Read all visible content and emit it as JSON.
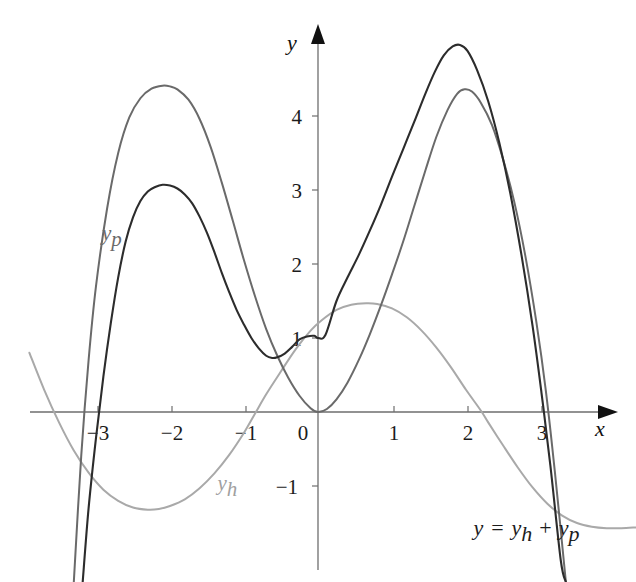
{
  "chart_data": {
    "type": "line",
    "title": "",
    "xlabel": "x",
    "ylabel": "y",
    "xlim": [
      -3.9,
      4.3
    ],
    "ylim": [
      -2.3,
      5.5
    ],
    "grid": false,
    "legend_position": "inline-curve-labels",
    "annotations": [
      {
        "text": "y = y_h + y_p",
        "x": 2.1,
        "y": -1.66
      }
    ],
    "xticks": [
      -3,
      -2,
      -1,
      0,
      1,
      2,
      3
    ],
    "xtick_labels": [
      "−3",
      "−2",
      "−1",
      "0",
      "1",
      "2",
      "3"
    ],
    "yticks": [
      -1,
      1,
      2,
      3,
      4
    ],
    "ytick_labels": [
      "−1",
      "1",
      "2",
      "3",
      "4"
    ],
    "series": [
      {
        "name": "y_p",
        "label": "y",
        "label_sub": "p",
        "color": "#6a6a6a",
        "width": 2.0,
        "label_x": -2.92,
        "label_y": 2.32,
        "description": "particular solution, even-like double-humped curve through the origin, peaks 4.4 near x=-2 and 4.35 near x=1.95",
        "points": [
          [
            -3.3,
            -2.3
          ],
          [
            -3.2,
            -0.6
          ],
          [
            -3.1,
            0.7
          ],
          [
            -3.0,
            1.7
          ],
          [
            -2.85,
            2.75
          ],
          [
            -2.7,
            3.5
          ],
          [
            -2.55,
            3.98
          ],
          [
            -2.4,
            4.24
          ],
          [
            -2.25,
            4.37
          ],
          [
            -2.1,
            4.41
          ],
          [
            -2.0,
            4.4
          ],
          [
            -1.9,
            4.36
          ],
          [
            -1.75,
            4.22
          ],
          [
            -1.6,
            3.96
          ],
          [
            -1.45,
            3.58
          ],
          [
            -1.3,
            3.1
          ],
          [
            -1.15,
            2.58
          ],
          [
            -1.0,
            2.05
          ],
          [
            -0.85,
            1.56
          ],
          [
            -0.7,
            1.12
          ],
          [
            -0.55,
            0.76
          ],
          [
            -0.4,
            0.46
          ],
          [
            -0.25,
            0.22
          ],
          [
            -0.1,
            0.05
          ],
          [
            0.0,
            0.0
          ],
          [
            0.12,
            0.04
          ],
          [
            0.25,
            0.17
          ],
          [
            0.4,
            0.4
          ],
          [
            0.55,
            0.7
          ],
          [
            0.7,
            1.05
          ],
          [
            0.85,
            1.44
          ],
          [
            1.0,
            1.86
          ],
          [
            1.15,
            2.3
          ],
          [
            1.3,
            2.78
          ],
          [
            1.45,
            3.26
          ],
          [
            1.6,
            3.72
          ],
          [
            1.75,
            4.08
          ],
          [
            1.88,
            4.3
          ],
          [
            1.98,
            4.36
          ],
          [
            2.08,
            4.33
          ],
          [
            2.2,
            4.18
          ],
          [
            2.35,
            3.88
          ],
          [
            2.5,
            3.42
          ],
          [
            2.65,
            2.85
          ],
          [
            2.8,
            2.12
          ],
          [
            2.95,
            1.22
          ],
          [
            3.08,
            0.28
          ],
          [
            3.2,
            -0.8
          ],
          [
            3.35,
            -2.3
          ]
        ]
      },
      {
        "name": "y_h",
        "label": "y",
        "label_sub": "h",
        "color": "#a9a9a9",
        "width": 2.0,
        "label_x": -1.36,
        "label_y": -1.05,
        "description": "homogeneous solution, smooth wave: min -1.30 near x=-2.2, rises through zero near x=-0.85, max 1.47 near x=0.73, falls through zero near x=2.25 to about -1.55 at right edge",
        "points": [
          [
            -3.9,
            0.8
          ],
          [
            -3.7,
            0.3
          ],
          [
            -3.5,
            -0.14
          ],
          [
            -3.3,
            -0.52
          ],
          [
            -3.1,
            -0.82
          ],
          [
            -2.9,
            -1.05
          ],
          [
            -2.7,
            -1.2
          ],
          [
            -2.5,
            -1.29
          ],
          [
            -2.3,
            -1.32
          ],
          [
            -2.15,
            -1.31
          ],
          [
            -2.0,
            -1.27
          ],
          [
            -1.8,
            -1.18
          ],
          [
            -1.6,
            -1.03
          ],
          [
            -1.4,
            -0.83
          ],
          [
            -1.2,
            -0.58
          ],
          [
            -1.0,
            -0.28
          ],
          [
            -0.85,
            -0.02
          ],
          [
            -0.7,
            0.24
          ],
          [
            -0.5,
            0.55
          ],
          [
            -0.3,
            0.85
          ],
          [
            -0.1,
            1.1
          ],
          [
            0.05,
            1.24
          ],
          [
            0.25,
            1.38
          ],
          [
            0.45,
            1.45
          ],
          [
            0.65,
            1.47
          ],
          [
            0.8,
            1.46
          ],
          [
            1.0,
            1.4
          ],
          [
            1.2,
            1.28
          ],
          [
            1.4,
            1.1
          ],
          [
            1.6,
            0.87
          ],
          [
            1.8,
            0.6
          ],
          [
            2.0,
            0.3
          ],
          [
            2.2,
            0.02
          ],
          [
            2.3,
            -0.14
          ],
          [
            2.5,
            -0.45
          ],
          [
            2.7,
            -0.75
          ],
          [
            2.9,
            -1.02
          ],
          [
            3.1,
            -1.24
          ],
          [
            3.3,
            -1.4
          ],
          [
            3.5,
            -1.5
          ],
          [
            3.7,
            -1.55
          ],
          [
            3.9,
            -1.57
          ],
          [
            4.1,
            -1.57
          ],
          [
            4.3,
            -1.56
          ]
        ]
      },
      {
        "name": "y",
        "label": "y",
        "label_sub": "",
        "color": "#2c2c2c",
        "width": 2.1,
        "label_x": null,
        "label_y": null,
        "description": "sum y = y_h + y_p, peaks 3.05 near x=-2 and 4.95 near x=1.9, local min 0.73 near x=-0.68, crosses y-axis at 1.0",
        "points": [
          [
            -3.18,
            -2.3
          ],
          [
            -3.1,
            -1.3
          ],
          [
            -3.0,
            -0.35
          ],
          [
            -2.9,
            0.48
          ],
          [
            -2.8,
            1.2
          ],
          [
            -2.7,
            1.82
          ],
          [
            -2.6,
            2.3
          ],
          [
            -2.5,
            2.63
          ],
          [
            -2.4,
            2.85
          ],
          [
            -2.3,
            2.98
          ],
          [
            -2.2,
            3.04
          ],
          [
            -2.1,
            3.07
          ],
          [
            -2.0,
            3.06
          ],
          [
            -1.9,
            3.02
          ],
          [
            -1.8,
            2.94
          ],
          [
            -1.7,
            2.82
          ],
          [
            -1.6,
            2.64
          ],
          [
            -1.5,
            2.42
          ],
          [
            -1.4,
            2.16
          ],
          [
            -1.3,
            1.88
          ],
          [
            -1.2,
            1.62
          ],
          [
            -1.1,
            1.38
          ],
          [
            -1.0,
            1.18
          ],
          [
            -0.9,
            1.0
          ],
          [
            -0.8,
            0.86
          ],
          [
            -0.7,
            0.76
          ],
          [
            -0.62,
            0.73
          ],
          [
            -0.55,
            0.74
          ],
          [
            -0.45,
            0.79
          ],
          [
            -0.35,
            0.88
          ],
          [
            -0.25,
            0.98
          ],
          [
            -0.15,
            1.02
          ],
          [
            -0.05,
            1.03
          ],
          [
            0.0,
            1.0
          ],
          [
            0.1,
            1.04
          ],
          [
            0.25,
            1.5
          ],
          [
            0.4,
            1.82
          ],
          [
            0.55,
            2.12
          ],
          [
            0.7,
            2.45
          ],
          [
            0.85,
            2.8
          ],
          [
            1.0,
            3.18
          ],
          [
            1.15,
            3.55
          ],
          [
            1.3,
            3.92
          ],
          [
            1.45,
            4.3
          ],
          [
            1.58,
            4.6
          ],
          [
            1.7,
            4.82
          ],
          [
            1.82,
            4.94
          ],
          [
            1.92,
            4.96
          ],
          [
            2.02,
            4.88
          ],
          [
            2.15,
            4.62
          ],
          [
            2.3,
            4.2
          ],
          [
            2.45,
            3.64
          ],
          [
            2.6,
            2.95
          ],
          [
            2.75,
            2.12
          ],
          [
            2.9,
            1.16
          ],
          [
            3.02,
            0.26
          ],
          [
            3.14,
            -0.72
          ],
          [
            3.28,
            -2.0
          ],
          [
            3.35,
            -2.3
          ]
        ]
      }
    ]
  },
  "labels": {
    "y_axis": "y",
    "x_axis": "x",
    "yp_base": "y",
    "yp_sub": "p",
    "yh_base": "y",
    "yh_sub": "h",
    "equation_y": "y",
    "equation_eq": "=",
    "equation_yh_base": "y",
    "equation_yh_sub": "h",
    "equation_plus": "+",
    "equation_yp_base": "y",
    "equation_yp_sub": "p"
  },
  "colors": {
    "sum_curve": "#2c2c2c",
    "yp_curve": "#6a6a6a",
    "yh_curve": "#a9a9a9",
    "axis": "#6e6e6e",
    "text": "#1c1c1c",
    "background": "#ffffff"
  }
}
